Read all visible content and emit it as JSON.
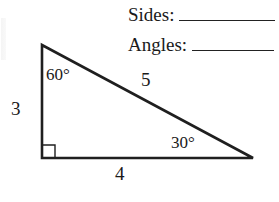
{
  "worksheet": {
    "fields": [
      {
        "label": "Sides:",
        "value": ""
      },
      {
        "label": "Angles:",
        "value": ""
      }
    ]
  },
  "triangle": {
    "type": "right triangle",
    "side_labels": {
      "vertical_leg": "3",
      "horizontal_leg": "4",
      "hypotenuse": "5"
    },
    "angle_labels": {
      "top_vertex": "60°",
      "right_vertex": "30°",
      "bottom_left_vertex": "right-angle-marker"
    },
    "vertices": {
      "top": [
        42,
        45
      ],
      "bottom_left": [
        42,
        158
      ],
      "bottom_right": [
        253,
        158
      ]
    },
    "stroke_color": "#1f1f1f"
  }
}
